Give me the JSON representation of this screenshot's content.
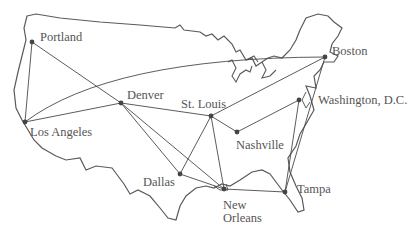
{
  "map": {
    "colors": {
      "outline": "#5a5a5a",
      "edge": "#4a4a4a",
      "node": "#444444",
      "label": "#555555"
    },
    "cities": [
      {
        "name": "Portland",
        "x": 32,
        "y": 42,
        "lx": 40,
        "ly": 30
      },
      {
        "name": "Los Angeles",
        "x": 25,
        "y": 122,
        "lx": 30,
        "ly": 125
      },
      {
        "name": "Denver",
        "x": 121,
        "y": 103,
        "lx": 127,
        "ly": 88
      },
      {
        "name": "St. Louis",
        "x": 211,
        "y": 116,
        "lx": 181,
        "ly": 97
      },
      {
        "name": "Nashville",
        "x": 237,
        "y": 132,
        "lx": 236,
        "ly": 138
      },
      {
        "name": "Dallas",
        "x": 180,
        "y": 174,
        "lx": 143,
        "ly": 175
      },
      {
        "name": "New Orleans",
        "x": 224,
        "y": 189,
        "lx": 223,
        "ly": 199
      },
      {
        "name": "Tampa",
        "x": 285,
        "y": 192,
        "lx": 297,
        "ly": 182
      },
      {
        "name": "Washington, D.C.",
        "x": 299,
        "y": 100,
        "lx": 318,
        "ly": 93
      },
      {
        "name": "Boston",
        "x": 325,
        "y": 57,
        "lx": 332,
        "ly": 44
      }
    ],
    "labels": [
      "Portland",
      "Los Angeles",
      "Denver",
      "St. Louis",
      "Nashville",
      "Dallas",
      "New Orleans",
      "Tampa",
      "Washington, D.C.",
      "Boston"
    ],
    "edges": [
      [
        "Portland",
        "Los Angeles"
      ],
      [
        "Portland",
        "Denver"
      ],
      [
        "Los Angeles",
        "Denver"
      ],
      [
        "Los Angeles",
        "Boston"
      ],
      [
        "Denver",
        "St. Louis"
      ],
      [
        "Denver",
        "Dallas"
      ],
      [
        "Denver",
        "New Orleans"
      ],
      [
        "St. Louis",
        "Dallas"
      ],
      [
        "St. Louis",
        "New Orleans"
      ],
      [
        "St. Louis",
        "Nashville"
      ],
      [
        "St. Louis",
        "Boston"
      ],
      [
        "Nashville",
        "Washington, D.C."
      ],
      [
        "Dallas",
        "New Orleans"
      ],
      [
        "New Orleans",
        "Tampa"
      ],
      [
        "Tampa",
        "Washington, D.C."
      ],
      [
        "Tampa",
        "Boston"
      ]
    ]
  }
}
